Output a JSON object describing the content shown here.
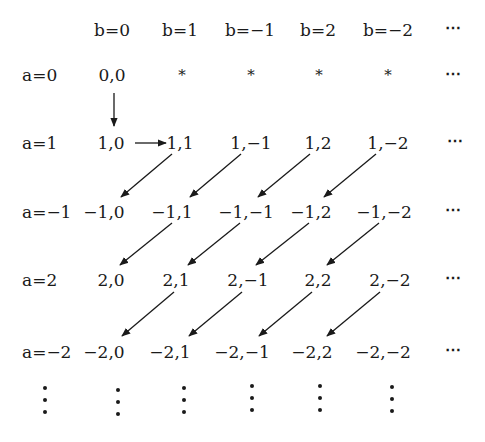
{
  "diagram": {
    "type": "enumeration-grid",
    "column_headers": [
      "b=0",
      "b=1",
      "b=−1",
      "b=2",
      "b=−2",
      "⋯"
    ],
    "rows": [
      {
        "label": "a=0",
        "cells": [
          "0,0",
          "*",
          "*",
          "*",
          "*",
          "⋯"
        ]
      },
      {
        "label": "a=1",
        "cells": [
          "1,0",
          "1,1",
          "1,−1",
          "1,2",
          "1,−2",
          "⋯"
        ]
      },
      {
        "label": "a=−1",
        "cells": [
          "−1,0",
          "−1,1",
          "−1,−1",
          "−1,2",
          "−1,−2",
          "⋯"
        ]
      },
      {
        "label": "a=2",
        "cells": [
          "2,0",
          "2,1",
          "2,−1",
          "2,2",
          "2,−2",
          "⋯"
        ]
      },
      {
        "label": "a=−2",
        "cells": [
          "−2,0",
          "−2,1",
          "−2,−1",
          "−2,2",
          "−2,−2",
          "⋯"
        ]
      }
    ],
    "continuation_marker": "⋮",
    "arrows": [
      {
        "from": "0,0",
        "to": "1,0",
        "direction": "down"
      },
      {
        "from": "1,0",
        "to": "1,1",
        "direction": "right"
      },
      {
        "from": "1,1",
        "to": "−1,0",
        "direction": "down-left"
      },
      {
        "from": "1,−1",
        "to": "−1,1",
        "direction": "down-left"
      },
      {
        "from": "1,2",
        "to": "−1,−1",
        "direction": "down-left"
      },
      {
        "from": "1,−2",
        "to": "−1,2",
        "direction": "down-left"
      },
      {
        "from": "−1,1",
        "to": "2,0",
        "direction": "down-left"
      },
      {
        "from": "−1,−1",
        "to": "2,1",
        "direction": "down-left"
      },
      {
        "from": "−1,2",
        "to": "2,−1",
        "direction": "down-left"
      },
      {
        "from": "−1,−2",
        "to": "2,2",
        "direction": "down-left"
      },
      {
        "from": "2,1",
        "to": "−2,0",
        "direction": "down-left"
      },
      {
        "from": "2,−1",
        "to": "−2,1",
        "direction": "down-left"
      },
      {
        "from": "2,2",
        "to": "−2,−1",
        "direction": "down-left"
      },
      {
        "from": "2,−2",
        "to": "−2,2",
        "direction": "down-left"
      }
    ],
    "colors": {
      "ink": "#1a1a1a",
      "background": "#ffffff"
    }
  }
}
